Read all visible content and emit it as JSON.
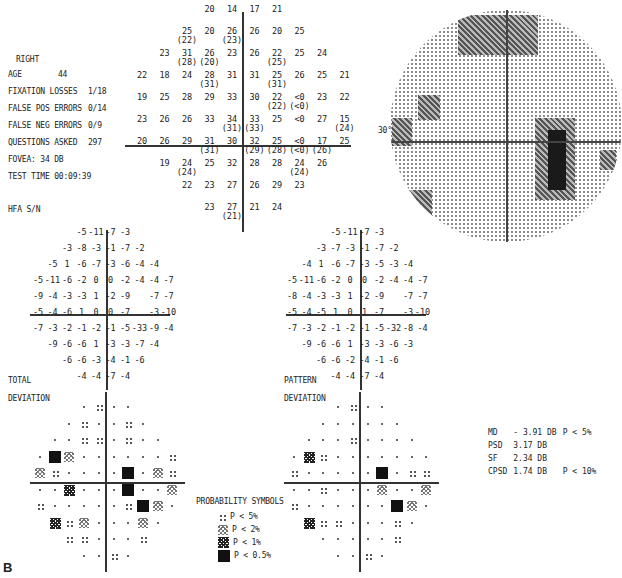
{
  "header": {
    "eye": "RIGHT",
    "age_label": "AGE",
    "age": "44",
    "fixation_label": "FIXATION LOSSES",
    "fixation": "1/18",
    "false_pos_label": "FALSE POS ERRORS",
    "false_pos": "0/14",
    "false_neg_label": "FALSE NEG ERRORS",
    "false_neg": "0/9",
    "questions_label": "QUESTIONS ASKED",
    "questions": "297",
    "fovea": "FOVEA:  34 DB",
    "test_time": "TEST TIME 00:09:39",
    "hfa": "HFA S/N"
  },
  "threshold": {
    "rows": [
      [
        null,
        null,
        null,
        "20",
        "14",
        "17",
        "21",
        null,
        null,
        null
      ],
      [
        null,
        null,
        "25|(22)",
        "20",
        "26|(23)",
        "26",
        "20",
        "25",
        null,
        null
      ],
      [
        null,
        "23",
        "31|(28)",
        "26|(20)",
        "23",
        "26",
        "22|(25)",
        "25",
        "24",
        null
      ],
      [
        "22",
        "18",
        "24",
        "28|(31)",
        "31",
        "31",
        "25|(31)",
        "26",
        "25",
        "21"
      ],
      [
        "19",
        "25",
        "28",
        "29",
        "33",
        "30",
        "22|(22)",
        "<0|(<0)",
        "23",
        "22"
      ],
      [
        "23",
        "26",
        "26",
        "33",
        "34|(31)",
        "33|(33)",
        "25",
        "<0",
        "27",
        "15|(24)"
      ],
      [
        "20",
        "26",
        "29",
        "31|(31)",
        "30",
        "32|(29)",
        "25|(28)",
        "<0|(<0)",
        "17|(26)",
        "25"
      ],
      [
        null,
        "19",
        "24|(24)",
        "25",
        "32",
        "28",
        "28",
        "24|(24)",
        "26",
        null
      ],
      [
        null,
        null,
        "22",
        "23",
        "27",
        "26",
        "29",
        "23",
        null,
        null
      ],
      [
        null,
        null,
        null,
        "23",
        "27|(21)",
        "21",
        "24",
        null,
        null,
        null
      ]
    ]
  },
  "greyscale": {
    "label_30": "30°"
  },
  "total_deviation": {
    "label1": "TOTAL",
    "label2": "DEVIATION",
    "rows": [
      [
        null,
        null,
        null,
        "-5",
        "-11",
        "-7",
        "-3",
        null,
        null,
        null
      ],
      [
        null,
        null,
        "-3",
        "-8",
        "-3",
        "-1",
        "-7",
        "-2",
        null,
        null
      ],
      [
        null,
        "-5",
        "1",
        "-6",
        "-7",
        "-3",
        "-6",
        "-4",
        "-4",
        null
      ],
      [
        "-5",
        "-11",
        "-6",
        "-2",
        "0",
        "0",
        "-2",
        "-4",
        "-4",
        "-7"
      ],
      [
        "-9",
        "-4",
        "-3",
        "-3",
        "1",
        "-2",
        "-9",
        null,
        "-7",
        "-7"
      ],
      [
        "-5",
        "-4",
        "-6",
        "1",
        "0",
        "0",
        "-7",
        null,
        "-3",
        "-10"
      ],
      [
        "-7",
        "-3",
        "-2",
        "-1",
        "-2",
        "-1",
        "-5",
        "-33",
        "-9",
        "-4"
      ],
      [
        null,
        "-9",
        "-6",
        "-6",
        "1",
        "-3",
        "-3",
        "-7",
        "-4",
        null
      ],
      [
        null,
        null,
        "-6",
        "-6",
        "-3",
        "-4",
        "-1",
        "-6",
        null,
        null
      ],
      [
        null,
        null,
        null,
        "-4",
        "-4",
        "-7",
        "-4",
        null,
        null,
        null
      ]
    ],
    "prob": [
      [
        null,
        null,
        null,
        ".",
        "p5",
        ".",
        ".",
        null,
        null,
        null
      ],
      [
        null,
        null,
        ".",
        "p5",
        ".",
        ".",
        "p5",
        ".",
        null,
        null
      ],
      [
        null,
        ".",
        ".",
        "p5",
        "p5",
        ".",
        "p5",
        ".",
        ".",
        null
      ],
      [
        ".",
        "p05",
        "p2",
        ".",
        ".",
        ".",
        ".",
        ".",
        ".",
        "p5"
      ],
      [
        "p2",
        "p5",
        ".",
        ".",
        ".",
        ".",
        "p05",
        ".",
        "p2",
        "p5"
      ],
      [
        ".",
        ".",
        "p1",
        ".",
        ".",
        ".",
        "p05",
        ".",
        ".",
        "p2"
      ],
      [
        "p5",
        ".",
        ".",
        ".",
        ".",
        ".",
        "p5",
        "p05",
        "p2",
        "."
      ],
      [
        null,
        "p1",
        "p5",
        "p2",
        ".",
        ".",
        ".",
        "p2",
        ".",
        null
      ],
      [
        null,
        null,
        "p5",
        "p5",
        ".",
        ".",
        ".",
        "p5",
        null,
        null
      ],
      [
        null,
        null,
        null,
        ".",
        ".",
        "p5",
        ".",
        null,
        null,
        null
      ]
    ]
  },
  "pattern_deviation": {
    "label1": "PATTERN",
    "label2": "DEVIATION",
    "rows": [
      [
        null,
        null,
        null,
        "-5",
        "-11",
        "-7",
        "-3",
        null,
        null,
        null
      ],
      [
        null,
        null,
        "-3",
        "-7",
        "-3",
        "-1",
        "-7",
        "-2",
        null,
        null
      ],
      [
        null,
        "-4",
        "1",
        "-6",
        "-7",
        "-3",
        "-5",
        "-3",
        "-4",
        null
      ],
      [
        "-5",
        "-11",
        "-6",
        "-2",
        "0",
        "0",
        "-2",
        "-4",
        "-4",
        "-7"
      ],
      [
        "-8",
        "-4",
        "-3",
        "-3",
        "1",
        "-2",
        "-9",
        null,
        "-7",
        "-7"
      ],
      [
        "-5",
        "-4",
        "-5",
        "1",
        "0",
        "1",
        "-7",
        null,
        "-3",
        "-10"
      ],
      [
        "-7",
        "-3",
        "-2",
        "-1",
        "-2",
        "-1",
        "-5",
        "-32",
        "-8",
        "-4"
      ],
      [
        null,
        "-9",
        "-6",
        "-6",
        "1",
        "-3",
        "-3",
        "-6",
        "-3",
        null
      ],
      [
        null,
        null,
        "-6",
        "-6",
        "-2",
        "-4",
        "-1",
        "-6",
        null,
        null
      ],
      [
        null,
        null,
        null,
        "-4",
        "-4",
        "-7",
        "-4",
        null,
        null,
        null
      ]
    ],
    "prob": [
      [
        null,
        null,
        null,
        ".",
        "p5",
        ".",
        ".",
        null,
        null,
        null
      ],
      [
        null,
        null,
        ".",
        ".",
        ".",
        ".",
        ".",
        ".",
        null,
        null
      ],
      [
        null,
        ".",
        ".",
        ".",
        "p5",
        ".",
        ".",
        ".",
        ".",
        null
      ],
      [
        ".",
        "p1",
        "p5",
        ".",
        ".",
        ".",
        ".",
        ".",
        ".",
        "."
      ],
      [
        "p5",
        ".",
        ".",
        ".",
        ".",
        ".",
        "p05",
        ".",
        "p5",
        "p5"
      ],
      [
        ".",
        ".",
        "p5",
        ".",
        ".",
        ".",
        "p2",
        ".",
        ".",
        "p2"
      ],
      [
        "p5",
        ".",
        ".",
        ".",
        ".",
        ".",
        ".",
        "p05",
        "p2",
        "."
      ],
      [
        null,
        "p1",
        "p5",
        "p5",
        ".",
        ".",
        ".",
        "p5",
        ".",
        null
      ],
      [
        null,
        null,
        ".",
        ".",
        ".",
        ".",
        ".",
        "p5",
        null,
        null
      ],
      [
        null,
        null,
        null,
        ".",
        ".",
        "p5",
        ".",
        null,
        null,
        null
      ]
    ]
  },
  "legend": {
    "title": "PROBABILITY SYMBOLS",
    "items": [
      {
        "sym": "p5",
        "label": "P <  5%"
      },
      {
        "sym": "p2",
        "label": "P <  2%"
      },
      {
        "sym": "p1",
        "label": "P <  1%"
      },
      {
        "sym": "p05",
        "label": "P < 0.5%"
      }
    ]
  },
  "indices": {
    "md_label": "MD",
    "md_value": "- 3.91 DB",
    "md_p": "P <  5%",
    "psd_label": "PSD",
    "psd_value": "3.17 DB",
    "sf_label": "SF",
    "sf_value": "2.34 DB",
    "cpsd_label": "CPSD",
    "cpsd_value": "1.74 DB",
    "cpsd_p": "P < 10%"
  },
  "figure_label": "B"
}
